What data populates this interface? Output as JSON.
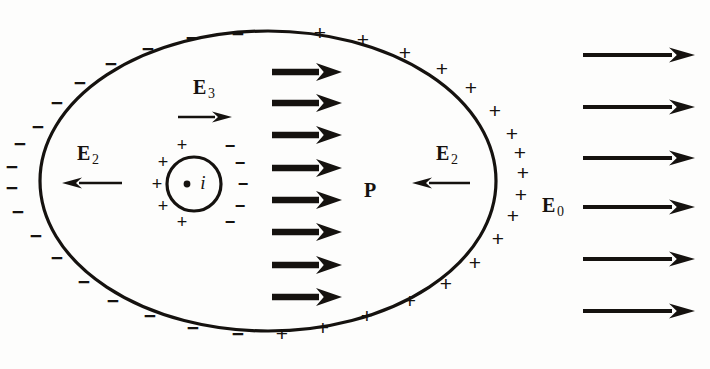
{
  "figure": {
    "background_color": "#fdfdfc",
    "ink_color": "#15120f"
  },
  "shapes": {
    "outer_ellipse": {
      "name": "dielectric-boundary",
      "cx": 268,
      "cy": 181,
      "rx": 228,
      "ry": 150,
      "stroke_width": 3.2
    },
    "inner_circle": {
      "name": "cavity-boundary",
      "cx": 194,
      "cy": 184,
      "r": 27,
      "stroke_width": 3.2
    },
    "center_dot": {
      "name": "cavity-center-dot",
      "cx": 187,
      "cy": 184,
      "r": 3.4
    }
  },
  "labels": {
    "e2_left": {
      "base": "E",
      "sub": "2",
      "x": 88,
      "y": 155
    },
    "e2_right": {
      "base": "E",
      "sub": "2",
      "x": 447,
      "y": 155
    },
    "e3": {
      "base": "E",
      "sub": "3",
      "x": 204,
      "y": 89
    },
    "e0": {
      "base": "E",
      "sub": "0",
      "x": 553,
      "y": 207
    },
    "p": {
      "text": "P",
      "x": 370,
      "y": 190
    },
    "i": {
      "text": "i",
      "x": 203,
      "y": 182
    }
  },
  "arrows": {
    "polarization": {
      "name": "polarization-arrow",
      "label": "P",
      "count": 8,
      "x_start": 272,
      "x_end": 342,
      "y_values": [
        72,
        103,
        135,
        168,
        200,
        232,
        265,
        297
      ],
      "stroke_width": 6.5,
      "head_length": 26,
      "head_half_width": 9
    },
    "external_field": {
      "name": "external-field-arrow",
      "label": "E0",
      "count": 6,
      "x_start": 583,
      "x_end": 695,
      "y_values": [
        55,
        107,
        158,
        207,
        259,
        311
      ],
      "stroke_width": 4.2,
      "head_length": 26,
      "head_half_width": 7.5
    },
    "e2_left_arrow": {
      "name": "e2-left-arrow",
      "x_start": 122,
      "x_end": 62,
      "y": 183,
      "stroke_width": 2.6,
      "head_length": 20,
      "head_half_width": 5.5,
      "direction": "left"
    },
    "e2_right_arrow": {
      "name": "e2-right-arrow",
      "x_start": 470,
      "x_end": 412,
      "y": 183,
      "stroke_width": 2.6,
      "head_length": 20,
      "head_half_width": 5.5,
      "direction": "left"
    },
    "e3_arrow": {
      "name": "e3-arrow",
      "x_start": 178,
      "x_end": 232,
      "y": 117,
      "stroke_width": 2.6,
      "head_length": 20,
      "head_half_width": 5.5,
      "direction": "right"
    }
  },
  "charges": {
    "outer_negative": {
      "symbol": "−",
      "name": "bound-negative-charge",
      "positions": [
        {
          "x": 238,
          "y": 33
        },
        {
          "x": 192,
          "y": 37
        },
        {
          "x": 148,
          "y": 48
        },
        {
          "x": 111,
          "y": 63
        },
        {
          "x": 80,
          "y": 82
        },
        {
          "x": 57,
          "y": 102
        },
        {
          "x": 38,
          "y": 126
        },
        {
          "x": 20,
          "y": 143
        },
        {
          "x": 12,
          "y": 166
        },
        {
          "x": 12,
          "y": 187
        },
        {
          "x": 18,
          "y": 211
        },
        {
          "x": 36,
          "y": 235
        },
        {
          "x": 57,
          "y": 257
        },
        {
          "x": 84,
          "y": 281
        },
        {
          "x": 113,
          "y": 300
        },
        {
          "x": 150,
          "y": 315
        },
        {
          "x": 193,
          "y": 327
        },
        {
          "x": 238,
          "y": 333
        }
      ]
    },
    "outer_positive": {
      "symbol": "+",
      "name": "bound-positive-charge",
      "positions": [
        {
          "x": 320,
          "y": 32
        },
        {
          "x": 363,
          "y": 39
        },
        {
          "x": 405,
          "y": 52
        },
        {
          "x": 442,
          "y": 68
        },
        {
          "x": 471,
          "y": 87
        },
        {
          "x": 495,
          "y": 110
        },
        {
          "x": 512,
          "y": 133
        },
        {
          "x": 520,
          "y": 152
        },
        {
          "x": 523,
          "y": 172
        },
        {
          "x": 521,
          "y": 194
        },
        {
          "x": 513,
          "y": 215
        },
        {
          "x": 498,
          "y": 238
        },
        {
          "x": 475,
          "y": 262
        },
        {
          "x": 446,
          "y": 283
        },
        {
          "x": 410,
          "y": 300
        },
        {
          "x": 367,
          "y": 315
        },
        {
          "x": 323,
          "y": 327
        },
        {
          "x": 282,
          "y": 333
        }
      ]
    },
    "cavity_positive": {
      "symbol": "+",
      "name": "cavity-positive-charge",
      "positions": [
        {
          "x": 182,
          "y": 145
        },
        {
          "x": 163,
          "y": 162
        },
        {
          "x": 157,
          "y": 184
        },
        {
          "x": 163,
          "y": 206
        },
        {
          "x": 182,
          "y": 222
        }
      ]
    },
    "cavity_negative": {
      "symbol": "−",
      "name": "cavity-negative-charge",
      "positions": [
        {
          "x": 230,
          "y": 146
        },
        {
          "x": 240,
          "y": 163
        },
        {
          "x": 243,
          "y": 184
        },
        {
          "x": 240,
          "y": 206
        },
        {
          "x": 230,
          "y": 222
        }
      ]
    }
  }
}
